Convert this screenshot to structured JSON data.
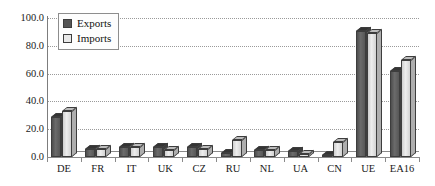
{
  "chart_data": {
    "type": "bar",
    "title": "",
    "subtitle": "",
    "xlabel": "",
    "ylabel": "",
    "categories": [
      "DE",
      "FR",
      "IT",
      "UK",
      "CZ",
      "RU",
      "NL",
      "UA",
      "CN",
      "UE",
      "EA16"
    ],
    "series": [
      {
        "name": "Exports",
        "color": "#555555",
        "values": [
          29.0,
          6.0,
          7.0,
          7.0,
          7.0,
          3.0,
          5.0,
          4.0,
          1.0,
          91.0,
          62.0
        ]
      },
      {
        "name": "Imports",
        "color": "#e8e8e8",
        "values": [
          33.0,
          6.0,
          7.0,
          5.0,
          6.0,
          12.0,
          5.0,
          2.0,
          11.0,
          89.0,
          70.0
        ]
      }
    ],
    "ylim": [
      0.0,
      100.0
    ],
    "ytick_values": [
      0.0,
      20.0,
      40.0,
      60.0,
      80.0,
      100.0
    ],
    "ytick_labels": [
      "0.0",
      "20.0",
      "40.0",
      "60.0",
      "80.0",
      "100.0"
    ],
    "grid": true,
    "grid_style": "dotted",
    "legend_position": "top-left",
    "bar_style": "3d"
  }
}
